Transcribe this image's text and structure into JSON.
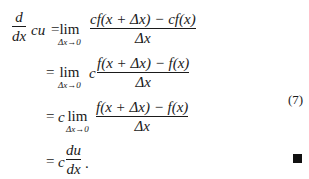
{
  "equation_number": "(7)",
  "qed_symbol": "■",
  "lines": [
    {
      "lhs": {
        "deriv_num": "d",
        "deriv_den": "dx",
        "after": "cu"
      },
      "equals": "=",
      "prefix": "",
      "limit": {
        "word": "lim",
        "sub": "Δx→0"
      },
      "between": "",
      "fraction": {
        "num": "cf(x + Δx) − cf(x)",
        "den": "Δx"
      }
    },
    {
      "equals": "=",
      "limit": {
        "word": "lim",
        "sub": "Δx→0"
      },
      "between": "c",
      "fraction": {
        "num": "f(x + Δx) − f(x)",
        "den": "Δx"
      }
    },
    {
      "equals": "=",
      "prefix": "c",
      "limit": {
        "word": "lim",
        "sub": "Δx→0"
      },
      "fraction": {
        "num": "f(x + Δx) − f(x)",
        "den": "Δx"
      }
    },
    {
      "equals": "=",
      "prefix": "c",
      "fraction": {
        "num": "du",
        "den": "dx"
      },
      "suffix": "."
    }
  ]
}
